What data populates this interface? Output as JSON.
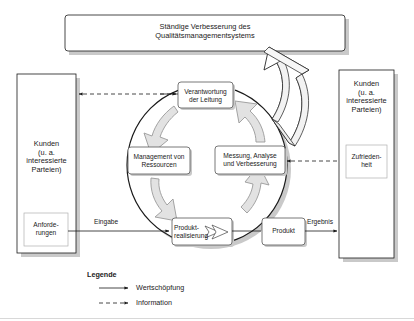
{
  "diagram": {
    "title_box": {
      "label": "Ständige Verbesserung des\nQualitätsmanagementsystems"
    },
    "left_party_box": {
      "label": "Kunden\n(u. a.\ninteressierte\nParteien)",
      "inner_box_label": "Anforde-\nrungen"
    },
    "right_party_box": {
      "label": "Kunden\n(u. a.\ninteressierte\nParteien)",
      "inner_box_label": "Zufrieden-\nheit"
    },
    "cycle_boxes": [
      {
        "id": "verantwortung-der-leitung",
        "label": "Verantwortung\nder Leitung"
      },
      {
        "id": "management-von-ressourcen",
        "label": "Management von\nRessourcen"
      },
      {
        "id": "messung-analyse-und-verbesserung",
        "label": "Messung, Analyse\nund Verbesserung"
      },
      {
        "id": "produktrealisierung",
        "label": "Produkt-\nrealisierung"
      }
    ],
    "output_box": {
      "label": "Produkt"
    },
    "flow_labels": {
      "input": "Eingabe",
      "output": "Ergebnis"
    },
    "legend": {
      "title": "Legende",
      "items": [
        {
          "id": "wertschoepfung",
          "label": "Wertschöpfung",
          "style": "solid"
        },
        {
          "id": "information",
          "label": "Information",
          "style": "dashed"
        }
      ]
    },
    "colors": {
      "stroke": "#1a1a1a",
      "box_fill": "#ffffff",
      "inner_box_stroke": "#b0b0b0",
      "shadow": "#c9c9c9",
      "cycle_arrow_fill": "#e2e2e2",
      "cycle_arrow_stroke": "#9a9a9a",
      "circle_shadow": "#c9c9c9",
      "text": "#1a1a1a"
    }
  }
}
